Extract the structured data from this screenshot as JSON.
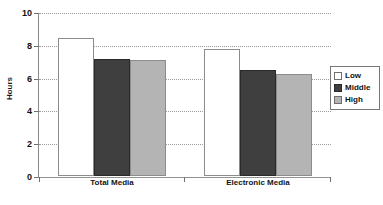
{
  "chart_data": {
    "type": "bar",
    "title": "",
    "xlabel": "",
    "ylabel": "Hours",
    "categories": [
      "Total Media",
      "Electronic Media"
    ],
    "series": [
      {
        "name": "Low",
        "values": [
          8.4,
          7.75
        ],
        "color": "#ffffff"
      },
      {
        "name": "Middle",
        "values": [
          7.15,
          6.45
        ],
        "color": "#3f3f3f"
      },
      {
        "name": "High",
        "values": [
          7.05,
          6.2
        ],
        "color": "#b4b4b4"
      }
    ],
    "ylim": [
      0,
      10
    ],
    "yticks": [
      0,
      2,
      4,
      6,
      8,
      10
    ],
    "ytick_labels": [
      "0",
      "2",
      "4",
      "6",
      "8",
      "10"
    ],
    "grid": true,
    "grid_style": "dotted",
    "legend_position": "right"
  },
  "axis": {
    "y_label": "Hours",
    "tick_0": "0",
    "tick_2": "2",
    "tick_4": "4",
    "tick_6": "6",
    "tick_8": "8",
    "tick_10": "10"
  },
  "categories": {
    "cat_0": "Total Media",
    "cat_1": "Electronic Media"
  },
  "legend": {
    "items": [
      {
        "label": "Low"
      },
      {
        "label": "Middle"
      },
      {
        "label": "High"
      }
    ],
    "label_low": "Low",
    "label_middle": "Middle",
    "label_high": "High"
  }
}
